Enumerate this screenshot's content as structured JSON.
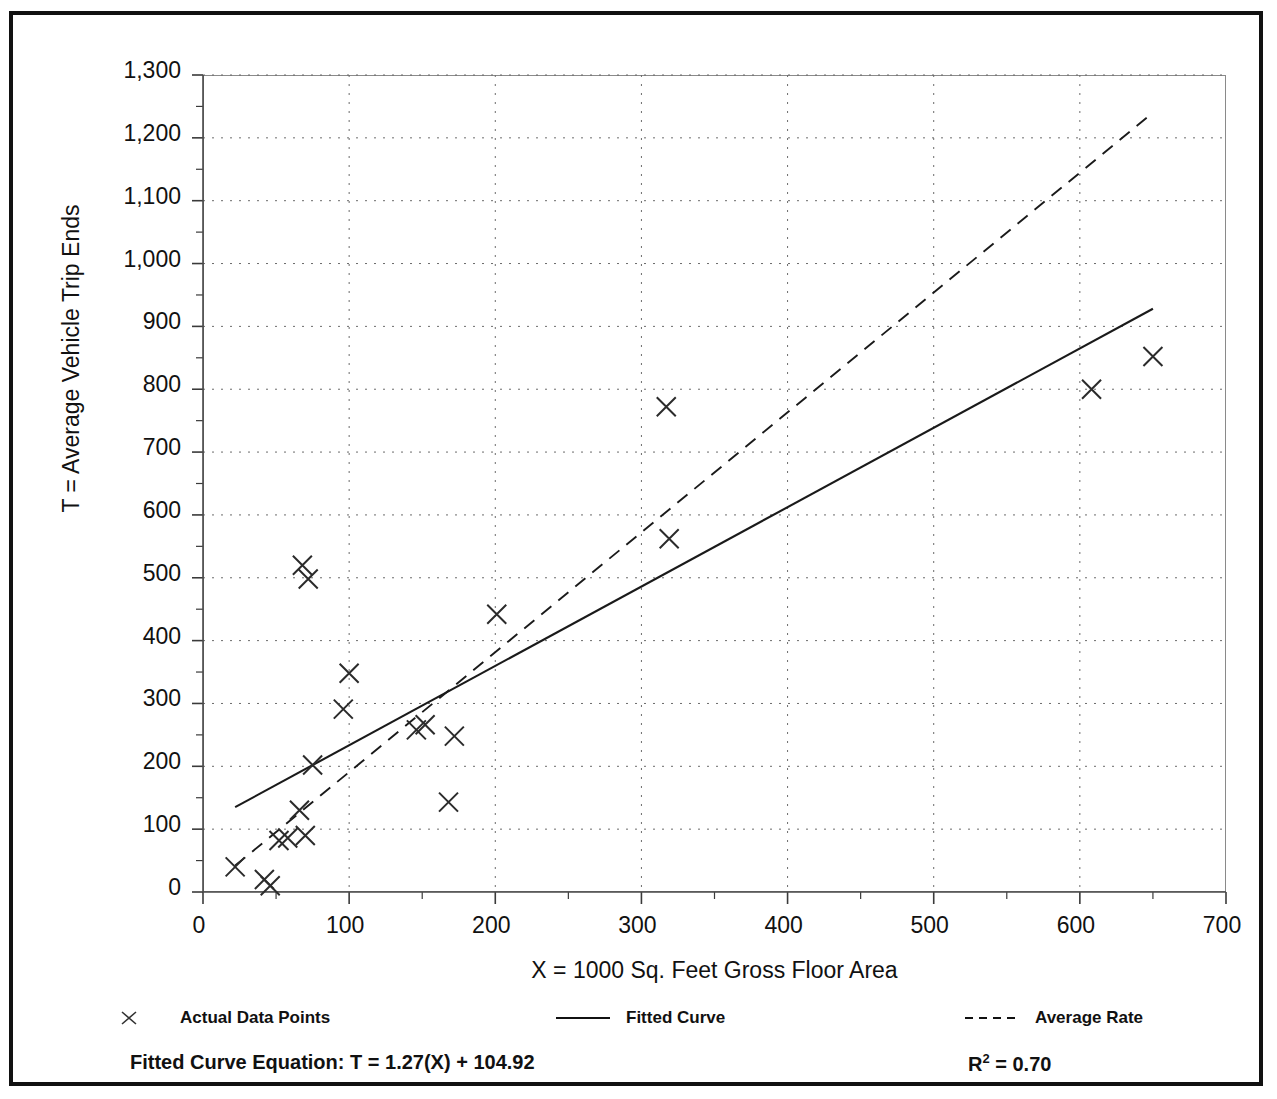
{
  "figure": {
    "title_fragment": "",
    "frame_color": "#111111",
    "background": "#ffffff"
  },
  "axis": {
    "y_title": "T = Average Vehicle Trip Ends",
    "x_title": "X = 1000 Sq. Feet Gross Floor Area",
    "y_ticks": [
      "0",
      "100",
      "200",
      "300",
      "400",
      "500",
      "600",
      "700",
      "800",
      "900",
      "1,000",
      "1,100",
      "1,200",
      "1,300"
    ],
    "x_ticks": [
      "0",
      "100",
      "200",
      "300",
      "400",
      "500",
      "600",
      "700"
    ]
  },
  "legend": {
    "items": [
      {
        "label": "Actual Data Points",
        "marker": "x-marker-icon"
      },
      {
        "label": "Fitted Curve",
        "marker": "solid-line-icon"
      },
      {
        "label": "Average Rate",
        "marker": "dashed-line-icon"
      }
    ]
  },
  "footer": {
    "equation": "Fitted Curve Equation:  T = 1.27(X) + 104.92",
    "r_squared_prefix": "R",
    "r_squared_exp": "2",
    "r_squared_value": " = 0.70"
  },
  "chart_data": {
    "type": "scatter",
    "title": "",
    "xlabel": "X = 1000 Sq. Feet Gross Floor Area",
    "ylabel": "T = Average Vehicle Trip Ends",
    "xlim": [
      0,
      700
    ],
    "ylim": [
      0,
      1300
    ],
    "x_tick_step": 100,
    "y_tick_step": 100,
    "x_minor_step": 50,
    "y_minor_step": 50,
    "grid": "dotted-major-both-axes",
    "legend_position": "below-plot",
    "series": [
      {
        "name": "Actual Data Points",
        "type": "scatter",
        "marker": "x",
        "points": [
          [
            22,
            40
          ],
          [
            42,
            20
          ],
          [
            46,
            10
          ],
          [
            52,
            82
          ],
          [
            58,
            86
          ],
          [
            66,
            130
          ],
          [
            70,
            90
          ],
          [
            68,
            520
          ],
          [
            72,
            498
          ],
          [
            75,
            202
          ],
          [
            96,
            291
          ],
          [
            100,
            348
          ],
          [
            146,
            258
          ],
          [
            152,
            266
          ],
          [
            168,
            143
          ],
          [
            172,
            248
          ],
          [
            201,
            442
          ],
          [
            317,
            772
          ],
          [
            319,
            562
          ],
          [
            608,
            800
          ],
          [
            650,
            852
          ]
        ]
      },
      {
        "name": "Fitted Curve",
        "type": "line",
        "style": "solid",
        "equation": "T = 1.27(X) + 104.92",
        "r_squared": 0.7,
        "slope": 1.27,
        "intercept": 104.92,
        "endpoints": [
          [
            22,
            135
          ],
          [
            650,
            928
          ]
        ]
      },
      {
        "name": "Average Rate",
        "type": "line",
        "style": "dashed",
        "endpoints": [
          [
            22,
            42
          ],
          [
            650,
            1240
          ]
        ]
      }
    ]
  }
}
